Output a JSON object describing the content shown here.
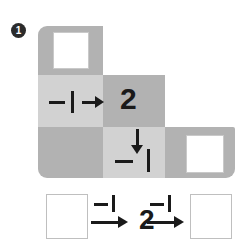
{
  "problem": {
    "number": "1",
    "bullet_style": "filled-circle-white-number"
  },
  "colors": {
    "cell_dark": "#b2b2b2",
    "cell_light": "#d2d2d2",
    "ink": "#1a1a1a",
    "box_fill": "#ffffff",
    "box_border": "#c9c9c9",
    "page_background": "#ffffff"
  },
  "grid_puzzle": {
    "cells": [
      {
        "row": 0,
        "col": 0,
        "shade": "dark",
        "content": "answer-box"
      },
      {
        "row": 1,
        "col": 0,
        "shade": "light",
        "content": "operator-horizontal"
      },
      {
        "row": 1,
        "col": 1,
        "shade": "dark",
        "content": "value-2"
      },
      {
        "row": 2,
        "col": 0,
        "shade": "dark",
        "content": "empty"
      },
      {
        "row": 2,
        "col": 1,
        "shade": "light",
        "content": "operator-vertical"
      },
      {
        "row": 2,
        "col": 2,
        "shade": "dark",
        "content": "answer-box"
      }
    ],
    "operator_horizontal": {
      "sign": "−",
      "operand": "1",
      "direction": "right",
      "full_label": "−1 →"
    },
    "known_value": "2",
    "operator_vertical": {
      "sign": "−",
      "operand": "1",
      "direction": "down",
      "full_label": "↓ −1"
    },
    "answer_box_top": {
      "value": "",
      "placeholder": ""
    },
    "answer_box_right": {
      "value": "",
      "placeholder": ""
    }
  },
  "sequence_row": {
    "start_box": {
      "value": "",
      "placeholder": ""
    },
    "arrow_1": {
      "sign": "−",
      "operand": "1",
      "label": "−1",
      "direction": "right"
    },
    "middle_value": "2",
    "arrow_2": {
      "sign": "−",
      "operand": "1",
      "label": "−1",
      "direction": "right"
    },
    "end_box": {
      "value": "",
      "placeholder": ""
    }
  }
}
